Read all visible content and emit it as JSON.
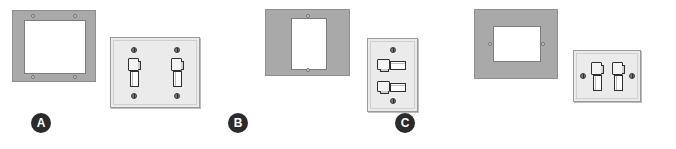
{
  "figure": {
    "background_color": "#ffffff",
    "ring_color": "#a9a9a9",
    "plate_color": "#ebebeb",
    "badge_color": "#2b2b2b",
    "opening_color": "#ffffff"
  },
  "copyright": {
    "text": "Copyright © Cengage Learning®"
  },
  "items": [
    {
      "badge": "A",
      "ring": {
        "name": "plaster-ring-two-gang-horizontal",
        "opening_orientation": "horizontal",
        "screw_count": 4,
        "screw_positions": "corners"
      },
      "plate": {
        "name": "switch-plate-two-gang",
        "gangs": 2,
        "toggle_orientation": "vertical",
        "screw_count": 4,
        "switches": [
          {
            "label": "toggle-switch-left",
            "orientation": "vertical"
          },
          {
            "label": "toggle-switch-right",
            "orientation": "vertical"
          }
        ]
      }
    },
    {
      "badge": "B",
      "ring": {
        "name": "plaster-ring-one-gang-vertical",
        "opening_orientation": "vertical",
        "screw_count": 2,
        "screw_positions": "top-bottom"
      },
      "plate": {
        "name": "switch-plate-one-gang-vertical",
        "gangs": 1,
        "toggle_orientation": "horizontal",
        "screw_count": 2,
        "switches": [
          {
            "label": "toggle-switch-upper",
            "orientation": "horizontal"
          },
          {
            "label": "toggle-switch-lower",
            "orientation": "horizontal"
          }
        ]
      }
    },
    {
      "badge": "C",
      "ring": {
        "name": "plaster-ring-two-gang-side-screws",
        "opening_orientation": "horizontal",
        "screw_count": 2,
        "screw_positions": "left-right"
      },
      "plate": {
        "name": "switch-plate-two-gang-side-screws",
        "gangs": 2,
        "toggle_orientation": "vertical",
        "screw_count": 2,
        "switches": [
          {
            "label": "toggle-switch-left",
            "orientation": "vertical"
          },
          {
            "label": "toggle-switch-right",
            "orientation": "vertical"
          }
        ]
      }
    }
  ]
}
